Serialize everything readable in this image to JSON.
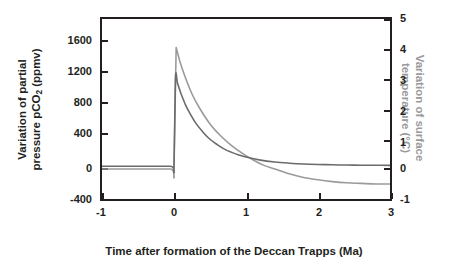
{
  "chart_data": {
    "type": "line",
    "title": "",
    "xlabel": "Time after formation of the Deccan Trapps (Ma)",
    "ylabel_left_line1": "Variation of partial",
    "ylabel_left_line2_pre": "pressure pCO",
    "ylabel_left_sub": "2",
    "ylabel_left_line2_post": " (ppmv)",
    "ylabel_right_line1": "Variation of surface",
    "ylabel_right_line2": "temperature (°C)",
    "xlim": [
      -1,
      3
    ],
    "ylim_left": [
      -400,
      1800
    ],
    "ylim_right": [
      -1,
      5
    ],
    "xticks": [
      "-1",
      "0",
      "1",
      "2",
      "3"
    ],
    "xtick_values": [
      -1,
      0,
      1,
      2,
      3
    ],
    "yticks_left": [
      "1600",
      "1200",
      "800",
      "400",
      "0",
      "-400"
    ],
    "ytick_values_left": [
      1600,
      1200,
      800,
      400,
      0,
      -400
    ],
    "yticks_right": [
      "5",
      "4",
      "3",
      "2",
      "1",
      "0",
      "-1"
    ],
    "ytick_values_right": [
      5,
      4,
      3,
      2,
      1,
      0,
      -1
    ],
    "grid": false,
    "legend": "none",
    "series": [
      {
        "name": "Variation of partial pressure pCO2 (ppmv)",
        "color": "#6b6b6b",
        "axis": "left",
        "x": [
          -1.0,
          -0.5,
          -0.05,
          0.0,
          0.02,
          0.05,
          0.1,
          0.15,
          0.2,
          0.3,
          0.4,
          0.5,
          0.6,
          0.7,
          0.8,
          0.9,
          1.0,
          1.2,
          1.4,
          1.6,
          1.8,
          2.0,
          2.2,
          2.4,
          2.6,
          2.8,
          3.0
        ],
        "values": [
          0,
          0,
          0,
          0,
          1075,
          1010,
          880,
          770,
          680,
          530,
          420,
          330,
          265,
          210,
          170,
          138,
          112,
          75,
          52,
          38,
          28,
          22,
          18,
          15,
          13,
          12,
          11
        ]
      },
      {
        "name": "Variation of surface temperature (°C)",
        "color": "#9a9a9a",
        "axis": "right",
        "x": [
          -1.0,
          -0.5,
          -0.05,
          0.0,
          0.03,
          0.08,
          0.15,
          0.25,
          0.35,
          0.5,
          0.65,
          0.8,
          0.95,
          1.1,
          1.25,
          1.4,
          1.6,
          1.8,
          2.0,
          2.2,
          2.4,
          2.6,
          2.8,
          3.0
        ],
        "values": [
          0,
          0,
          0,
          0,
          4.05,
          3.6,
          3.1,
          2.5,
          2.05,
          1.5,
          1.1,
          0.78,
          0.52,
          0.3,
          0.12,
          0.0,
          -0.16,
          -0.28,
          -0.36,
          -0.42,
          -0.46,
          -0.48,
          -0.5,
          -0.5
        ]
      }
    ],
    "annotations": {
      "peak_pco2_ppmv": 1075,
      "peak_temperature_c": 4.05,
      "event_time_ma": 0
    },
    "colors": {
      "axis": "#231f20",
      "pco2_curve": "#6b6b6b",
      "temperature_curve": "#9a9a9a",
      "background": "#ffffff"
    }
  }
}
